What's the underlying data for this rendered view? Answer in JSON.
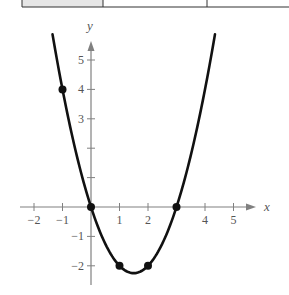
{
  "table_fragment": {
    "cells": [
      "",
      "",
      ""
    ],
    "shaded_first_cell": true,
    "shade_color": "#e6e6e6"
  },
  "chart_data": {
    "type": "line",
    "title": "",
    "function": "y = x^2 - 3x",
    "xlabel": "x",
    "ylabel": "y",
    "xlim": [
      -2.5,
      5.8
    ],
    "ylim": [
      -2.5,
      5.5
    ],
    "x_ticks": [
      -2,
      -1,
      1,
      2,
      3,
      4,
      5
    ],
    "x_tick_labels": [
      "−2",
      "−1",
      "1",
      "2",
      "",
      "4",
      "5"
    ],
    "y_ticks": [
      -2,
      -1,
      1,
      2,
      3,
      4,
      5
    ],
    "y_tick_labels": [
      "−2",
      "−1",
      "",
      "",
      "3",
      "4",
      "5"
    ],
    "grid": false,
    "series": [
      {
        "name": "parabola",
        "x": [
          -1.35,
          -1,
          0,
          1,
          1.5,
          2,
          3,
          4.35
        ],
        "y": [
          5.37,
          4,
          0,
          -2,
          -2.25,
          -2,
          0,
          5.37
        ]
      }
    ],
    "points": [
      {
        "x": -1,
        "y": 4
      },
      {
        "x": 0,
        "y": 0
      },
      {
        "x": 1,
        "y": -2
      },
      {
        "x": 2,
        "y": -2
      },
      {
        "x": 3,
        "y": 0
      }
    ],
    "colors": {
      "curve": "#111111",
      "axis": "#808080",
      "text": "#555555"
    }
  }
}
